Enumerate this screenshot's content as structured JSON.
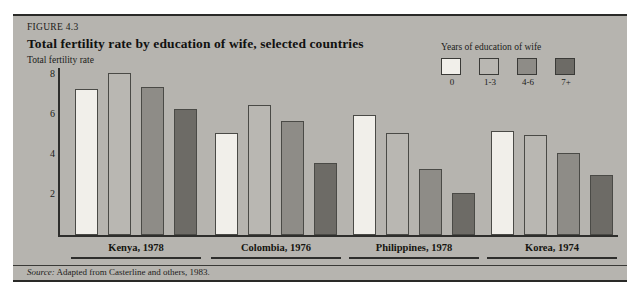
{
  "figure": {
    "label": "FIGURE 4.3",
    "title": "Total fertility rate by education of wife, selected countries",
    "axis_title": "Total fertility rate",
    "source_prefix": "Source:",
    "source_text": "Adapted from Casterline and others, 1983."
  },
  "legend": {
    "title": "Years of education of wife",
    "items": [
      {
        "label": "0",
        "color": "#f1efea"
      },
      {
        "label": "1-3",
        "color": "#b9b7b2"
      },
      {
        "label": "4-6",
        "color": "#8e8c87"
      },
      {
        "label": "7+",
        "color": "#6d6b66"
      }
    ]
  },
  "chart_data": {
    "type": "bar",
    "title": "Total fertility rate by education of wife, selected countries",
    "xlabel": "",
    "ylabel": "Total fertility rate",
    "ylim": [
      0,
      8.6
    ],
    "yticks": [
      2,
      4,
      6,
      8
    ],
    "grid": false,
    "legend_position": "top-right",
    "categories": [
      "Kenya, 1978",
      "Colombia, 1976",
      "Philippines, 1978",
      "Korea, 1974"
    ],
    "series": [
      {
        "name": "0",
        "color": "#f1efea",
        "values": [
          7.3,
          5.1,
          6.0,
          5.2
        ]
      },
      {
        "name": "1-3",
        "color": "#b9b7b2",
        "values": [
          8.1,
          6.5,
          5.1,
          5.0
        ]
      },
      {
        "name": "4-6",
        "color": "#8e8c87",
        "values": [
          7.4,
          5.7,
          3.3,
          4.1
        ]
      },
      {
        "name": "7+",
        "color": "#6d6b66",
        "values": [
          6.3,
          3.6,
          2.1,
          3.0
        ]
      }
    ]
  }
}
